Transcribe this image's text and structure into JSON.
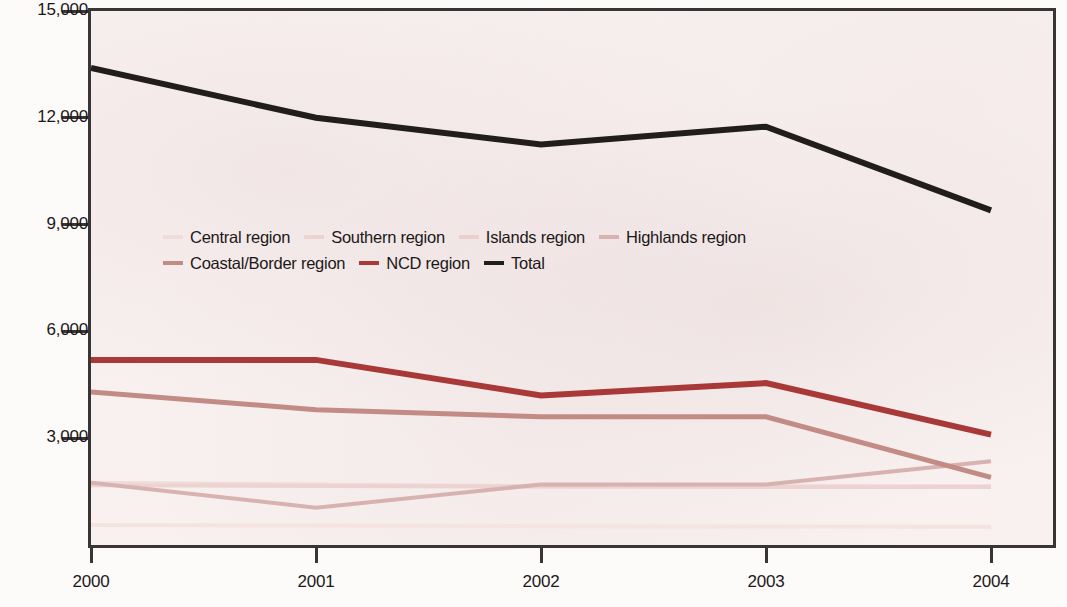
{
  "chart_data": {
    "type": "line",
    "title": "",
    "xlabel": "",
    "ylabel": "",
    "x": [
      "2000",
      "2001",
      "2002",
      "2003",
      "2004"
    ],
    "categories": [
      "2000",
      "2001",
      "2002",
      "2003",
      "2004"
    ],
    "ylim": [
      0,
      15000
    ],
    "xlim": [
      "2000",
      "2004"
    ],
    "ytick_labels": [
      "15,000",
      "12,000",
      "9,000",
      "6,000",
      "3,000"
    ],
    "ytick_values": [
      15000,
      12000,
      9000,
      6000,
      3000
    ],
    "grid": false,
    "legend_position": "inside-upper-middle",
    "series": [
      {
        "name": "Central region",
        "color": "#f0dcda",
        "width": 4,
        "values": [
          1750,
          1700,
          1650,
          1650,
          1650
        ]
      },
      {
        "name": "Southern region",
        "color": "#ecd3d1",
        "width": 4,
        "values": [
          1680,
          1660,
          1640,
          1630,
          1630
        ]
      },
      {
        "name": "Islands region",
        "color": "#f4e3e1",
        "width": 4,
        "values": [
          560,
          545,
          530,
          520,
          510
        ]
      },
      {
        "name": "Highlands region",
        "color": "#d8b2b0",
        "width": 4,
        "values": [
          1750,
          1050,
          1700,
          1700,
          2350
        ]
      },
      {
        "name": "Coastal/Border region",
        "color": "#c28b86",
        "width": 5,
        "values": [
          4300,
          3800,
          3600,
          3600,
          1900
        ]
      },
      {
        "name": "NCD region",
        "color": "#a93838",
        "width": 6,
        "values": [
          5200,
          5200,
          4200,
          4550,
          3100
        ]
      },
      {
        "name": "Total",
        "color": "#211d1d",
        "width": 6,
        "values": [
          13400,
          12000,
          11250,
          11750,
          9400
        ]
      }
    ]
  },
  "legend": {
    "rows": [
      [
        {
          "label": "Central region",
          "color": "#f0dcda"
        },
        {
          "label": "Southern region",
          "color": "#ecd3d1"
        },
        {
          "label": "Islands region",
          "color": "#eccfcc"
        },
        {
          "label": "Highlands region",
          "color": "#d8b2b0"
        }
      ],
      [
        {
          "label": "Coastal/Border region",
          "color": "#c28b86"
        },
        {
          "label": "NCD region",
          "color": "#a93838"
        },
        {
          "label": "Total",
          "color": "#211d1d"
        }
      ]
    ]
  },
  "axes": {
    "y_labels": [
      "15,000",
      "12,000",
      "9,000",
      "6,000",
      "3,000"
    ],
    "x_labels": [
      "2000",
      "2001",
      "2002",
      "2003",
      "2004"
    ]
  },
  "colors": {
    "plot_background": "#f8f1f0",
    "axis": "#3a3535",
    "text": "#1c1818"
  }
}
